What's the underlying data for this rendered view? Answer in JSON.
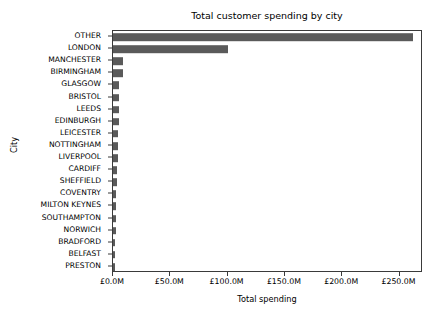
{
  "chart_data": {
    "type": "bar",
    "orientation": "horizontal",
    "title": "Total customer spending by city",
    "xlabel": "Total spending",
    "ylabel": "City",
    "grid": false,
    "legend": null,
    "xlim": [
      0,
      270.5
    ],
    "xtick_labels": [
      "£0.0M",
      "£50.0M",
      "£100.0M",
      "£150.0M",
      "£200.0M",
      "£250.0M"
    ],
    "xtick_values": [
      0,
      50,
      100,
      150,
      200,
      250
    ],
    "bar_color": "#5a5a5a",
    "units": "millions of GBP",
    "categories": [
      "OTHER",
      "LONDON",
      "MANCHESTER",
      "BIRMINGHAM",
      "GLASGOW",
      "BRISTOL",
      "LEEDS",
      "EDINBURGH",
      "LEICESTER",
      "NOTTINGHAM",
      "LIVERPOOL",
      "CARDIFF",
      "SHEFFIELD",
      "COVENTRY",
      "MILTON KEYNES",
      "SOUTHAMPTON",
      "NORWICH",
      "BRADFORD",
      "BELFAST",
      "PRESTON"
    ],
    "values": [
      262.0,
      100.5,
      8.8,
      8.4,
      5.6,
      5.4,
      5.0,
      4.8,
      4.6,
      4.4,
      4.2,
      3.6,
      3.4,
      2.8,
      2.6,
      2.4,
      2.2,
      2.0,
      1.9,
      1.8
    ]
  }
}
